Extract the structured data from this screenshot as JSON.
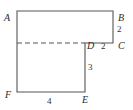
{
  "figure": {
    "background_color": "#ffffff",
    "stroke_color": "#555555",
    "label_color": "#2b2b2b",
    "outline_points": "17,11 113,11 113,43 85,43 85,92 17,92",
    "dashed_line": {
      "x1": 17,
      "y1": 43,
      "x2": 85,
      "y2": 43,
      "dash_pattern": "5,3"
    },
    "vertices": [
      {
        "id": "A",
        "label": "A",
        "x": 17,
        "y": 11,
        "label_x": 4,
        "label_y": 13
      },
      {
        "id": "B",
        "label": "B",
        "x": 113,
        "y": 11,
        "label_x": 118,
        "label_y": 13
      },
      {
        "id": "C",
        "label": "C",
        "x": 113,
        "y": 43,
        "label_x": 118,
        "label_y": 41
      },
      {
        "id": "D",
        "label": "D",
        "x": 85,
        "y": 43,
        "label_x": 87,
        "label_y": 41
      },
      {
        "id": "E",
        "label": "E",
        "x": 85,
        "y": 92,
        "label_x": 82,
        "label_y": 95
      },
      {
        "id": "F",
        "label": "F",
        "x": 17,
        "y": 92,
        "label_x": 5,
        "label_y": 90
      }
    ],
    "measures": [
      {
        "id": "bc",
        "label": "2",
        "segment": "BC",
        "label_x": 117,
        "label_y": 24
      },
      {
        "id": "dc",
        "label": "2",
        "segment": "DC",
        "label_x": 101,
        "label_y": 41
      },
      {
        "id": "de",
        "label": "3",
        "segment": "DE",
        "label_x": 88,
        "label_y": 62
      },
      {
        "id": "fe",
        "label": "4",
        "segment": "FE",
        "label_x": 47,
        "label_y": 96
      }
    ]
  }
}
